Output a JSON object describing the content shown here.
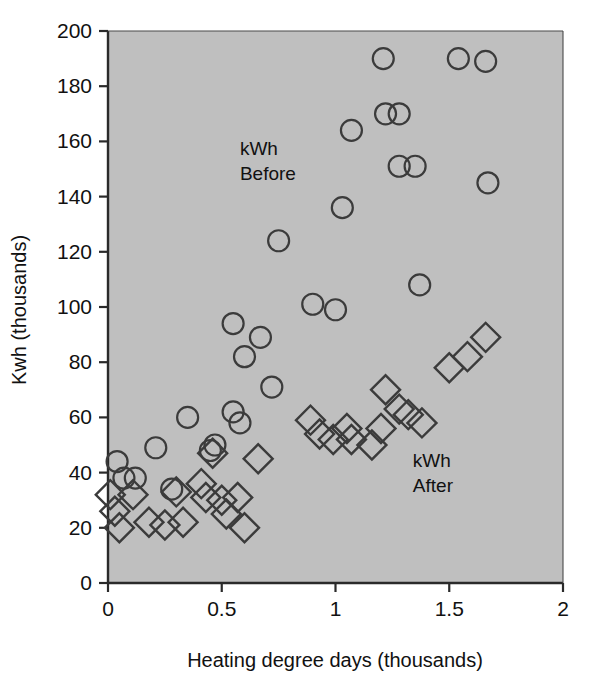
{
  "chart_data": {
    "type": "scatter",
    "title": "",
    "xlabel": "Heating degree days (thousands)",
    "ylabel": "Kwh (thousands)",
    "xlim": [
      0,
      2
    ],
    "ylim": [
      0,
      200
    ],
    "xticks": [
      "0",
      "0.5",
      "1",
      "1.5",
      "2"
    ],
    "xtick_values": [
      0,
      0.5,
      1,
      1.5,
      2
    ],
    "yticks": [
      "0",
      "20",
      "40",
      "60",
      "80",
      "100",
      "120",
      "140",
      "160",
      "180",
      "200"
    ],
    "ytick_values": [
      0,
      20,
      40,
      60,
      80,
      100,
      120,
      140,
      160,
      180,
      200
    ],
    "grid": false,
    "plot_background": "#bfbfbf",
    "marker_stroke": "#3b3b3b",
    "legend_position": "in-plot-annotations",
    "annotations": [
      {
        "text": "kWh\nBefore",
        "line1": "kWh",
        "line2": "Before",
        "x": 0.58,
        "y": 155
      },
      {
        "text": "kWh\nAfter",
        "line1": "kWh",
        "line2": "After",
        "x": 1.34,
        "y": 42
      }
    ],
    "series": [
      {
        "name": "kWh Before",
        "marker": "circle",
        "points": [
          {
            "x": 0.04,
            "y": 44
          },
          {
            "x": 0.07,
            "y": 38
          },
          {
            "x": 0.12,
            "y": 38
          },
          {
            "x": 0.21,
            "y": 49
          },
          {
            "x": 0.28,
            "y": 34
          },
          {
            "x": 0.35,
            "y": 60
          },
          {
            "x": 0.45,
            "y": 48
          },
          {
            "x": 0.47,
            "y": 50
          },
          {
            "x": 0.55,
            "y": 94
          },
          {
            "x": 0.55,
            "y": 62
          },
          {
            "x": 0.58,
            "y": 58
          },
          {
            "x": 0.6,
            "y": 82
          },
          {
            "x": 0.67,
            "y": 89
          },
          {
            "x": 0.72,
            "y": 71
          },
          {
            "x": 0.75,
            "y": 124
          },
          {
            "x": 0.9,
            "y": 101
          },
          {
            "x": 1.0,
            "y": 99
          },
          {
            "x": 1.03,
            "y": 136
          },
          {
            "x": 1.07,
            "y": 164
          },
          {
            "x": 1.21,
            "y": 190
          },
          {
            "x": 1.22,
            "y": 170
          },
          {
            "x": 1.28,
            "y": 170
          },
          {
            "x": 1.28,
            "y": 151
          },
          {
            "x": 1.35,
            "y": 151
          },
          {
            "x": 1.37,
            "y": 108
          },
          {
            "x": 1.54,
            "y": 190
          },
          {
            "x": 1.66,
            "y": 189
          },
          {
            "x": 1.67,
            "y": 145
          }
        ]
      },
      {
        "name": "kWh After",
        "marker": "diamond",
        "points": [
          {
            "x": 0.01,
            "y": 32
          },
          {
            "x": 0.03,
            "y": 26
          },
          {
            "x": 0.05,
            "y": 20
          },
          {
            "x": 0.11,
            "y": 32
          },
          {
            "x": 0.18,
            "y": 22
          },
          {
            "x": 0.25,
            "y": 21
          },
          {
            "x": 0.3,
            "y": 33
          },
          {
            "x": 0.33,
            "y": 22
          },
          {
            "x": 0.41,
            "y": 36
          },
          {
            "x": 0.43,
            "y": 31
          },
          {
            "x": 0.46,
            "y": 47
          },
          {
            "x": 0.5,
            "y": 30
          },
          {
            "x": 0.52,
            "y": 25
          },
          {
            "x": 0.57,
            "y": 31
          },
          {
            "x": 0.6,
            "y": 20
          },
          {
            "x": 0.66,
            "y": 45
          },
          {
            "x": 0.89,
            "y": 59
          },
          {
            "x": 0.93,
            "y": 54
          },
          {
            "x": 0.99,
            "y": 52
          },
          {
            "x": 1.05,
            "y": 56
          },
          {
            "x": 1.07,
            "y": 52
          },
          {
            "x": 1.16,
            "y": 50
          },
          {
            "x": 1.2,
            "y": 56
          },
          {
            "x": 1.22,
            "y": 70
          },
          {
            "x": 1.28,
            "y": 63
          },
          {
            "x": 1.32,
            "y": 61
          },
          {
            "x": 1.38,
            "y": 58
          },
          {
            "x": 1.5,
            "y": 78
          },
          {
            "x": 1.58,
            "y": 82
          },
          {
            "x": 1.66,
            "y": 89
          }
        ]
      }
    ]
  }
}
